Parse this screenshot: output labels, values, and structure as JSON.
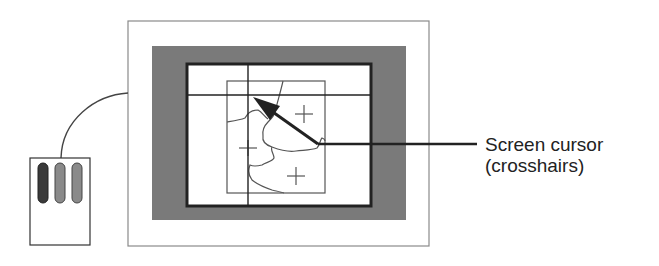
{
  "diagram": {
    "components": {
      "monitor": {
        "label": "monitor-frame"
      },
      "screen": {
        "label": "display-screen"
      },
      "map_region": {
        "label": "map-region",
        "plus_markers": 3
      },
      "mouse": {
        "label": "mouse",
        "buttons": 3
      }
    },
    "callout": {
      "line1": "Screen cursor",
      "line2": "(crosshairs)"
    },
    "colors": {
      "bezel": "#7a7a7a",
      "mouse_button_left": "#3a3a3a",
      "mouse_button_mid": "#8a8a8a",
      "mouse_button_right": "#8a8a8a",
      "line": "#333333",
      "text": "#222222"
    }
  }
}
